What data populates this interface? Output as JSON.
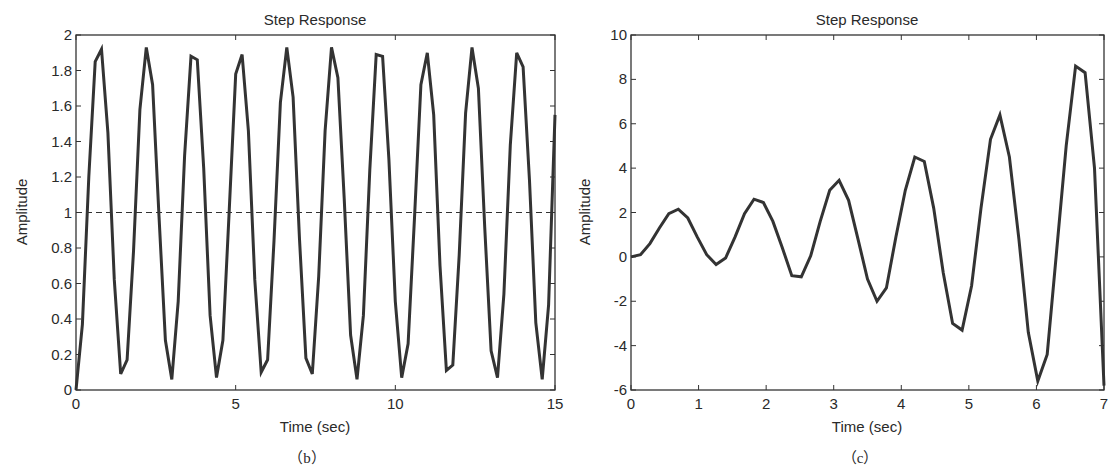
{
  "chart_data": [
    {
      "id": "b",
      "type": "line",
      "title": "Step Response",
      "xlabel": "Time (sec)",
      "ylabel": "Amplitude",
      "caption": "（b）",
      "xlim": [
        0,
        15
      ],
      "ylim": [
        0,
        2
      ],
      "xticks": [
        0,
        5,
        10,
        15
      ],
      "xtick_labels": [
        "0",
        "5",
        "10",
        "15"
      ],
      "yticks": [
        0,
        0.2,
        0.4,
        0.6,
        0.8,
        1,
        1.2,
        1.4,
        1.6,
        1.8,
        2
      ],
      "ytick_labels": [
        "0",
        "0.2",
        "0.4",
        "0.6",
        "0.8",
        "1",
        "1.2",
        "1.4",
        "1.6",
        "1.8",
        "2"
      ],
      "grid": false,
      "reference_line": {
        "y": 1,
        "style": "dashed"
      },
      "series": [
        {
          "name": "step response",
          "x": [
            0,
            0.2,
            0.4,
            0.6,
            0.8,
            1.0,
            1.2,
            1.4,
            1.6,
            1.8,
            2.0,
            2.2,
            2.4,
            2.6,
            2.8,
            3.0,
            3.2,
            3.4,
            3.6,
            3.8,
            4.0,
            4.2,
            4.4,
            4.6,
            4.8,
            5.0,
            5.2,
            5.4,
            5.6,
            5.8,
            6.0,
            6.2,
            6.4,
            6.6,
            6.8,
            7.0,
            7.2,
            7.4,
            7.6,
            7.8,
            8.0,
            8.2,
            8.4,
            8.6,
            8.8,
            9.0,
            9.2,
            9.4,
            9.6,
            9.8,
            10.0,
            10.2,
            10.4,
            10.6,
            10.8,
            11.0,
            11.2,
            11.4,
            11.6,
            11.8,
            12.0,
            12.2,
            12.4,
            12.6,
            12.8,
            13.0,
            13.2,
            13.4,
            13.6,
            13.8,
            14.0,
            14.2,
            14.4,
            14.6,
            14.8,
            15.0
          ],
          "values": [
            0.0,
            0.37,
            1.2,
            1.85,
            1.92,
            1.45,
            0.62,
            0.09,
            0.17,
            0.78,
            1.58,
            1.93,
            1.72,
            0.98,
            0.28,
            0.06,
            0.5,
            1.32,
            1.88,
            1.86,
            1.25,
            0.42,
            0.07,
            0.28,
            1.02,
            1.78,
            1.89,
            1.46,
            0.62,
            0.1,
            0.17,
            0.84,
            1.62,
            1.93,
            1.65,
            0.85,
            0.18,
            0.09,
            0.64,
            1.46,
            1.93,
            1.76,
            1.08,
            0.31,
            0.06,
            0.42,
            1.24,
            1.89,
            1.88,
            1.3,
            0.5,
            0.07,
            0.26,
            0.97,
            1.72,
            1.9,
            1.55,
            0.7,
            0.11,
            0.14,
            0.76,
            1.56,
            1.93,
            1.7,
            0.92,
            0.22,
            0.07,
            0.54,
            1.38,
            1.9,
            1.82,
            1.18,
            0.38,
            0.06,
            0.48,
            1.55
          ]
        }
      ]
    },
    {
      "id": "c",
      "type": "line",
      "title": "Step Response",
      "xlabel": "Time (sec)",
      "ylabel": "Amplitude",
      "caption": "（c）",
      "xlim": [
        0,
        7
      ],
      "ylim": [
        -6,
        10
      ],
      "xticks": [
        0,
        1,
        2,
        3,
        4,
        5,
        6,
        7
      ],
      "xtick_labels": [
        "0",
        "1",
        "2",
        "3",
        "4",
        "5",
        "6",
        "7"
      ],
      "yticks": [
        -6,
        -4,
        -2,
        0,
        2,
        4,
        6,
        8,
        10
      ],
      "ytick_labels": [
        "-6",
        "-4",
        "-2",
        "0",
        "2",
        "4",
        "6",
        "8",
        "10"
      ],
      "grid": false,
      "series": [
        {
          "name": "step response",
          "x": [
            0,
            0.14,
            0.28,
            0.42,
            0.56,
            0.7,
            0.84,
            0.98,
            1.12,
            1.26,
            1.4,
            1.54,
            1.68,
            1.82,
            1.96,
            2.1,
            2.24,
            2.38,
            2.52,
            2.66,
            2.8,
            2.94,
            3.08,
            3.22,
            3.36,
            3.5,
            3.64,
            3.78,
            3.92,
            4.06,
            4.2,
            4.34,
            4.48,
            4.62,
            4.76,
            4.9,
            5.04,
            5.18,
            5.32,
            5.46,
            5.6,
            5.74,
            5.88,
            6.02,
            6.16,
            6.3,
            6.44,
            6.58,
            6.72,
            6.86,
            7.0
          ],
          "values": [
            0,
            0.1,
            0.6,
            1.3,
            1.95,
            2.15,
            1.75,
            0.9,
            0.1,
            -0.35,
            -0.05,
            0.9,
            1.95,
            2.6,
            2.45,
            1.6,
            0.4,
            -0.85,
            -0.9,
            0.05,
            1.6,
            3.0,
            3.45,
            2.55,
            0.8,
            -1.0,
            -2.0,
            -1.4,
            0.9,
            3.0,
            4.5,
            4.3,
            2.2,
            -0.7,
            -3.0,
            -3.3,
            -1.3,
            2.2,
            5.3,
            6.4,
            4.5,
            0.8,
            -3.4,
            -5.6,
            -4.4,
            0.3,
            5.0,
            8.6,
            8.3,
            4.0,
            -5.8
          ]
        }
      ]
    }
  ],
  "layout": {
    "line_color": "#333333",
    "axis_color": "#333333",
    "plots": [
      {
        "left": 76,
        "top": 35,
        "right": 555,
        "bottom": 390
      },
      {
        "left": 631,
        "top": 35,
        "right": 1104,
        "bottom": 390
      }
    ]
  }
}
